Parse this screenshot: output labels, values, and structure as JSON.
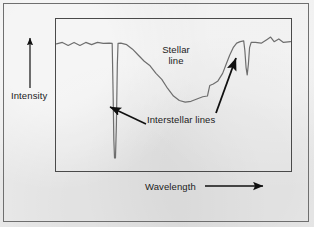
{
  "figure": {
    "kind": "stellar-spectrum-diagram",
    "background_color": "#e9e9e9",
    "outer_border_color": "#6f6f6f",
    "plot_border_color": "#4a4a4a",
    "curve_color": "#6e6e6e",
    "arrow_color": "#111111",
    "text_color": "#1b1b1b"
  },
  "axes": {
    "y_axis": {
      "label": "Intensity",
      "arrow": "up-arrow",
      "direction": "up"
    },
    "x_axis": {
      "label": "Wavelength",
      "arrow": "right-arrow",
      "direction": "right"
    }
  },
  "annotations": {
    "stellar": {
      "label": "Stellar line",
      "line1": "Stellar",
      "line2": "line"
    },
    "interstellar": {
      "label": "Interstellar lines",
      "pointer_left": "arrow-to-left-interstellar-line",
      "pointer_right": "arrow-to-right-interstellar-line"
    }
  },
  "chart_data": {
    "type": "line",
    "title": "",
    "xlabel": "Wavelength",
    "ylabel": "Intensity",
    "grid": false,
    "legend": false,
    "axis_ticks": false,
    "features": [
      {
        "name": "left continuum",
        "kind": "continuum",
        "x_range": [
          0.0,
          0.22
        ],
        "level": 0.83
      },
      {
        "name": "left interstellar line",
        "kind": "narrow-absorption",
        "center_x": 0.25,
        "depth_to": 0.08,
        "width": 0.02
      },
      {
        "name": "stellar line",
        "kind": "broad-absorption",
        "center_x": 0.52,
        "depth_to": 0.45,
        "width": 0.4
      },
      {
        "name": "right interstellar line",
        "kind": "narrow-absorption",
        "center_x": 0.77,
        "depth_to": 0.63,
        "width": 0.02
      },
      {
        "name": "right continuum",
        "kind": "continuum",
        "x_range": [
          0.8,
          1.0
        ],
        "level": 0.85
      }
    ],
    "trace_points": [
      [
        0.0,
        0.835
      ],
      [
        0.025,
        0.845
      ],
      [
        0.05,
        0.825
      ],
      [
        0.075,
        0.845
      ],
      [
        0.1,
        0.825
      ],
      [
        0.125,
        0.845
      ],
      [
        0.15,
        0.83
      ],
      [
        0.175,
        0.845
      ],
      [
        0.2,
        0.838
      ],
      [
        0.225,
        0.84
      ],
      [
        0.238,
        0.838
      ],
      [
        0.242,
        0.5
      ],
      [
        0.245,
        0.2
      ],
      [
        0.248,
        0.08
      ],
      [
        0.252,
        0.08
      ],
      [
        0.256,
        0.3
      ],
      [
        0.26,
        0.7
      ],
      [
        0.263,
        0.838
      ],
      [
        0.275,
        0.84
      ],
      [
        0.3,
        0.83
      ],
      [
        0.325,
        0.8
      ],
      [
        0.35,
        0.76
      ],
      [
        0.375,
        0.72
      ],
      [
        0.4,
        0.69
      ],
      [
        0.425,
        0.64
      ],
      [
        0.45,
        0.6
      ],
      [
        0.475,
        0.54
      ],
      [
        0.5,
        0.49
      ],
      [
        0.525,
        0.46
      ],
      [
        0.55,
        0.45
      ],
      [
        0.575,
        0.455
      ],
      [
        0.6,
        0.47
      ],
      [
        0.625,
        0.485
      ],
      [
        0.645,
        0.49
      ],
      [
        0.655,
        0.56
      ],
      [
        0.67,
        0.57
      ],
      [
        0.69,
        0.59
      ],
      [
        0.71,
        0.64
      ],
      [
        0.725,
        0.7
      ],
      [
        0.74,
        0.76
      ],
      [
        0.755,
        0.81
      ],
      [
        0.77,
        0.84
      ],
      [
        0.785,
        0.85
      ],
      [
        0.8,
        0.855
      ],
      [
        0.805,
        0.79
      ],
      [
        0.81,
        0.68
      ],
      [
        0.815,
        0.63
      ],
      [
        0.82,
        0.7
      ],
      [
        0.825,
        0.81
      ],
      [
        0.832,
        0.845
      ],
      [
        0.85,
        0.845
      ],
      [
        0.875,
        0.84
      ],
      [
        0.9,
        0.865
      ],
      [
        0.915,
        0.88
      ],
      [
        0.93,
        0.85
      ],
      [
        0.95,
        0.868
      ],
      [
        0.97,
        0.845
      ],
      [
        1.0,
        0.85
      ]
    ],
    "xlim": [
      0,
      1
    ],
    "ylim": [
      0,
      1
    ]
  }
}
